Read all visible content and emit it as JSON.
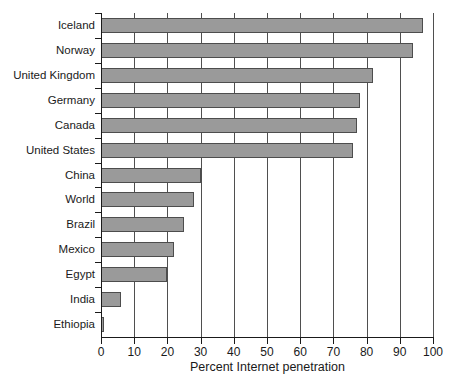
{
  "chart_data": {
    "type": "bar",
    "orientation": "horizontal",
    "title": "",
    "xlabel": "Percent Internet penetration",
    "ylabel": "",
    "categories": [
      "Iceland",
      "Norway",
      "United Kingdom",
      "Germany",
      "Canada",
      "United States",
      "China",
      "World",
      "Brazil",
      "Mexico",
      "Egypt",
      "India",
      "Ethiopia"
    ],
    "values": [
      97,
      94,
      82,
      78,
      77,
      76,
      30,
      28,
      25,
      22,
      20,
      6,
      1
    ],
    "xlim": [
      0,
      100
    ],
    "xticks": [
      0,
      10,
      20,
      30,
      40,
      50,
      60,
      70,
      80,
      90,
      100
    ],
    "grid": "vertical",
    "legend": "none",
    "colors": {
      "bar_fill": "#9a9a9a",
      "bar_border": "#4d4d4d",
      "gridline": "#4f4f4f",
      "axis": "#1a1a1a",
      "text": "#1a1a1a",
      "background": "#ffffff"
    }
  }
}
